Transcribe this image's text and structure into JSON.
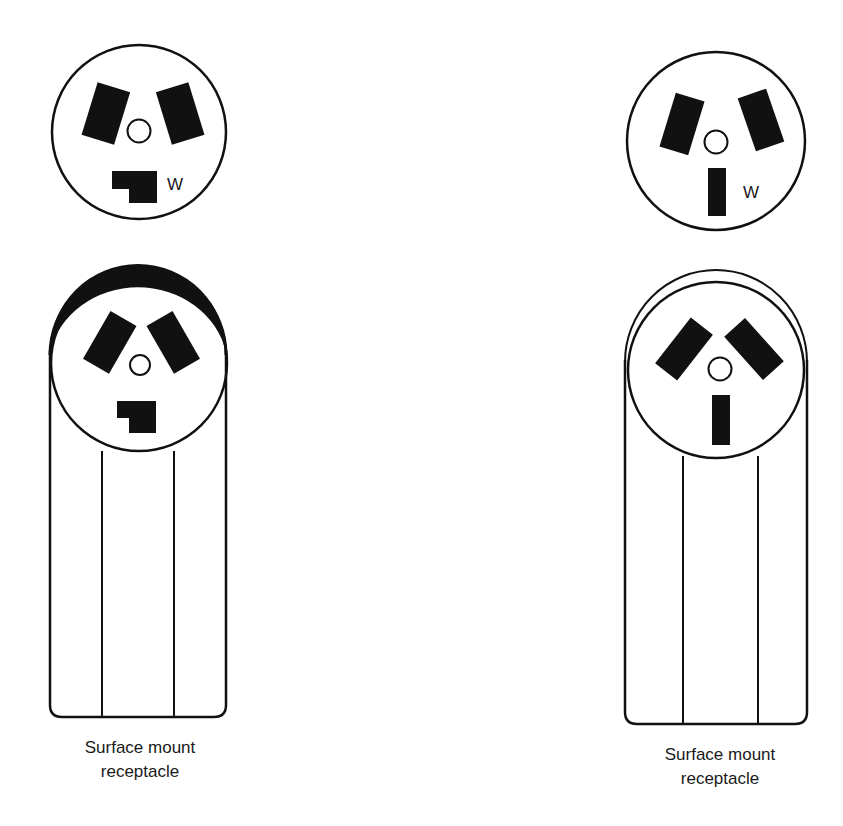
{
  "diagram": {
    "type": "electrical receptacle illustration",
    "colors": {
      "ink": "#111111",
      "background": "#ffffff"
    },
    "left_column": {
      "face": {
        "description": "3-slot receptacle face with L-shaped white (neutral) slot",
        "slots": [
          "angled-left-blade",
          "angled-right-blade",
          "L-shaped-neutral"
        ],
        "neutral_label": "W",
        "ground": "round-hole"
      },
      "surface_mount": {
        "description": "Surface mount receptacle with thick top cap and L-shaped neutral slot",
        "caption_line1": "Surface mount",
        "caption_line2": "receptacle"
      }
    },
    "right_column": {
      "face": {
        "description": "3-slot receptacle face with straight vertical white (neutral) slot",
        "slots": [
          "angled-left-blade",
          "angled-right-blade",
          "straight-neutral"
        ],
        "neutral_label": "W",
        "ground": "round-hole"
      },
      "surface_mount": {
        "description": "Surface mount receptacle with thin double-line top and straight neutral slot",
        "caption_line1": "Surface mount",
        "caption_line2": "receptacle"
      }
    }
  }
}
